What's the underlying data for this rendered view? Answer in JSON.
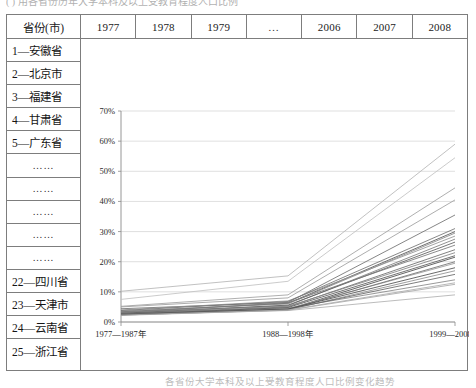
{
  "captions": {
    "top": "(    )  用各省份历年大学本科及以上受教育程度人口比例",
    "bottom": "各省份大学本科及以上受教育程度人口比例变化趋势"
  },
  "table": {
    "header": {
      "province_label": "省份(市)",
      "years": [
        "1977",
        "1978",
        "1979",
        "…",
        "2006",
        "2007",
        "2008"
      ]
    },
    "provinces": [
      "1—安徽省",
      "2—北京市",
      "3—福建省",
      "4—甘肃省",
      "5—广东省",
      "……",
      "……",
      "……",
      "……",
      "……",
      "22—四川省",
      "23—天津市",
      "24—云南省",
      "25—浙江省"
    ]
  },
  "chart_data": {
    "type": "line",
    "title": "",
    "xlabel": "",
    "ylabel": "",
    "categories": [
      "1977—1987年",
      "1988—1998年",
      "1999—2008年"
    ],
    "ylim": [
      0,
      70
    ],
    "ytick_labels": [
      "0%",
      "10%",
      "20%",
      "30%",
      "40%",
      "50%",
      "60%",
      "70%"
    ],
    "ytick_values": [
      0,
      10,
      20,
      30,
      40,
      50,
      60,
      70
    ],
    "grid": true,
    "legend": "none",
    "series": [
      {
        "name": "1—安徽省",
        "values": [
          2.5,
          4.2,
          21.5
        ]
      },
      {
        "name": "2—北京市",
        "values": [
          10.2,
          15.3,
          59.0
        ]
      },
      {
        "name": "3—福建省",
        "values": [
          7.5,
          13.5,
          54.5
        ]
      },
      {
        "name": "4—甘肃省",
        "values": [
          3.2,
          5.4,
          27.5
        ]
      },
      {
        "name": "5—广东省",
        "values": [
          5.2,
          9.0,
          44.5
        ]
      },
      {
        "name": "6",
        "values": [
          2.3,
          4.0,
          17.0
        ]
      },
      {
        "name": "7",
        "values": [
          2.8,
          5.0,
          24.0
        ]
      },
      {
        "name": "8",
        "values": [
          3.4,
          6.2,
          30.0
        ]
      },
      {
        "name": "9",
        "values": [
          2.6,
          4.4,
          19.5
        ]
      },
      {
        "name": "10",
        "values": [
          4.4,
          6.5,
          35.5
        ]
      },
      {
        "name": "11",
        "values": [
          2.4,
          3.8,
          9.0
        ]
      },
      {
        "name": "12",
        "values": [
          3.0,
          4.6,
          14.0
        ]
      },
      {
        "name": "13",
        "values": [
          2.7,
          4.2,
          15.8
        ]
      },
      {
        "name": "14",
        "values": [
          2.9,
          5.6,
          26.5
        ]
      },
      {
        "name": "15",
        "values": [
          3.6,
          6.0,
          29.5
        ]
      },
      {
        "name": "16",
        "values": [
          2.2,
          3.9,
          12.5
        ]
      },
      {
        "name": "17",
        "values": [
          3.1,
          6.4,
          25.5
        ]
      },
      {
        "name": "18",
        "values": [
          2.5,
          4.8,
          22.0
        ]
      },
      {
        "name": "19",
        "values": [
          4.0,
          7.0,
          28.5
        ]
      },
      {
        "name": "20",
        "values": [
          2.6,
          4.1,
          20.0
        ]
      },
      {
        "name": "21",
        "values": [
          3.3,
          5.2,
          23.0
        ]
      },
      {
        "name": "22—四川省",
        "values": [
          2.4,
          4.3,
          18.0
        ]
      },
      {
        "name": "23—天津市",
        "values": [
          5.0,
          8.0,
          40.5
        ]
      },
      {
        "name": "24—云南省",
        "values": [
          2.3,
          4.0,
          13.0
        ]
      },
      {
        "name": "25—浙江省",
        "values": [
          3.8,
          6.8,
          31.0
        ]
      }
    ],
    "line_shades": [
      "#4a4a4a",
      "#b6b6b6",
      "#c2c2c2",
      "#7d7d7d",
      "#a0a0a0",
      "#8f8f8f",
      "#6b6b6b",
      "#555555",
      "#9a9a9a",
      "#707070",
      "#b0b0b0",
      "#878787",
      "#666666",
      "#5d5d5d",
      "#8a8a8a",
      "#a8a8a8",
      "#777777",
      "#5a5a5a",
      "#949494",
      "#6f6f6f",
      "#828282",
      "#4f4f4f",
      "#9e9e9e",
      "#ababab",
      "#737373"
    ]
  }
}
